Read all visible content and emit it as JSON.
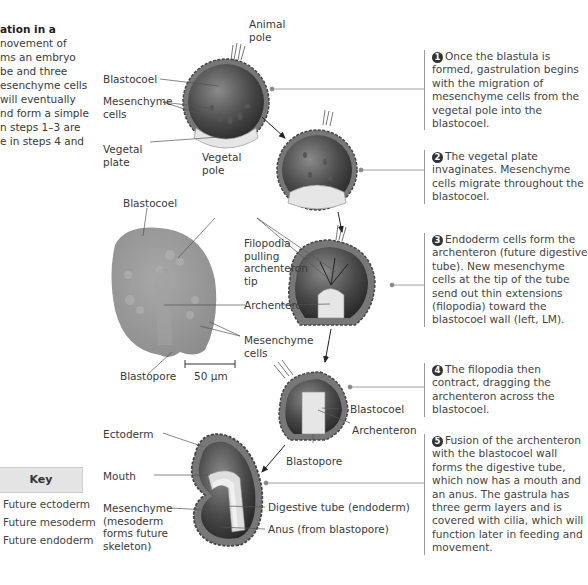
{
  "intro": {
    "title": "ation in a",
    "lines": [
      "novement of",
      "ms an embryo",
      "be and three",
      "esenchyme cells",
      " will eventually",
      "nd form a simple",
      "n steps 1–3 are",
      "e in steps 4 and"
    ]
  },
  "labels": {
    "animal_pole": [
      "Animal",
      "pole"
    ],
    "blastocoel_1": "Blastocoel",
    "mesenchyme_cells_1": [
      "Mesenchyme",
      "cells"
    ],
    "vegetal_plate": [
      "Vegetal",
      "plate"
    ],
    "vegetal_pole": [
      "Vegetal",
      "pole"
    ],
    "blastocoel_lm": "Blastocoel",
    "filopodia": [
      "Filopodia",
      "pulling",
      "archenteron",
      "tip"
    ],
    "archenteron_3": "Archenteron",
    "mesenchyme_cells_lm": [
      "Mesenchyme",
      "cells"
    ],
    "blastopore_lm": "Blastopore",
    "scale_bar": "50 µm",
    "blastocoel_4": "Blastocoel",
    "archenteron_4": "Archenteron",
    "blastopore_4": "Blastopore",
    "ectoderm": "Ectoderm",
    "mouth": "Mouth",
    "mesenchyme_5": [
      "Mesenchyme",
      "(mesoderm",
      "forms future",
      "skeleton)"
    ],
    "digestive_tube": "Digestive tube (endoderm)",
    "anus": "Anus (from blastopore)"
  },
  "steps": [
    {
      "num": "1",
      "text": "Once the blastula is formed, gastrulation begins with the migration of mesenchyme cells from the vegetal pole into the blastocoel."
    },
    {
      "num": "2",
      "text": "The vegetal plate invaginates. Mesenchyme cells migrate throughout the blastocoel."
    },
    {
      "num": "3",
      "text": "Endoderm cells form the archenteron (future digestive tube). New mesenchyme cells at the tip of the tube send out thin extensions (filopodia) toward the blastocoel wall (left, LM)."
    },
    {
      "num": "4",
      "text": "The filopodia then contract, dragging the archenteron across the blastocoel."
    },
    {
      "num": "5",
      "text": "Fusion of the archenteron with the blastocoel wall forms the digestive tube, which now has a mouth and an anus. The gastrula has three germ layers and is covered with cilia, which will function later in feeding and movement."
    }
  ],
  "key": {
    "title": "Key",
    "items": [
      {
        "label": "Future ectoderm",
        "color": "#8a8a8a"
      },
      {
        "label": "Future mesoderm",
        "color": "#5a5a5a"
      },
      {
        "label": "Future endoderm",
        "color": "#e8e8e8"
      }
    ]
  },
  "colors": {
    "embryo_dark": "#3c3c3c",
    "embryo_mid": "#6e6e6e",
    "micrograph": "#9a9a9a",
    "leader_line": "#555555",
    "step_rule": "#9a9a9a"
  }
}
